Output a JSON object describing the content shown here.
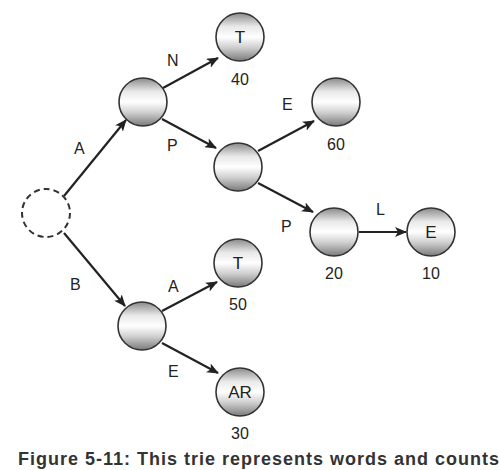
{
  "diagram": {
    "type": "trie",
    "root": {
      "id": "root",
      "style": "dashed"
    },
    "nodes": [
      {
        "id": "n_A",
        "letter": "",
        "count": ""
      },
      {
        "id": "n_AN",
        "letter": "T",
        "count": "40"
      },
      {
        "id": "n_AP",
        "letter": "",
        "count": ""
      },
      {
        "id": "n_APE",
        "letter": "",
        "count": "60"
      },
      {
        "id": "n_APP",
        "letter": "",
        "count": "20"
      },
      {
        "id": "n_APPL",
        "letter": "E",
        "count": "10"
      },
      {
        "id": "n_B",
        "letter": "",
        "count": ""
      },
      {
        "id": "n_BA",
        "letter": "T",
        "count": "50"
      },
      {
        "id": "n_BE",
        "letter": "AR",
        "count": "30"
      }
    ],
    "edges": [
      {
        "from": "root",
        "to": "n_A",
        "label": "A"
      },
      {
        "from": "n_A",
        "to": "n_AN",
        "label": "N"
      },
      {
        "from": "n_A",
        "to": "n_AP",
        "label": "P"
      },
      {
        "from": "n_AP",
        "to": "n_APE",
        "label": "E"
      },
      {
        "from": "n_AP",
        "to": "n_APP",
        "label": "P"
      },
      {
        "from": "n_APP",
        "to": "n_APPL",
        "label": "L"
      },
      {
        "from": "root",
        "to": "n_B",
        "label": "B"
      },
      {
        "from": "n_B",
        "to": "n_BA",
        "label": "A"
      },
      {
        "from": "n_B",
        "to": "n_BE",
        "label": "E"
      }
    ]
  },
  "caption": "Figure 5-11: This trie represents words and counts"
}
